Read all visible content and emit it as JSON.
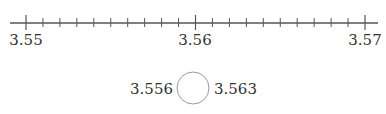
{
  "number_line": {
    "start": 3.55,
    "end": 3.57,
    "minor_step": 0.001,
    "labels": [
      "3.55",
      "3.56",
      "3.57"
    ]
  },
  "comparison": {
    "left": "3.556",
    "right": "3.563",
    "blank": ""
  }
}
